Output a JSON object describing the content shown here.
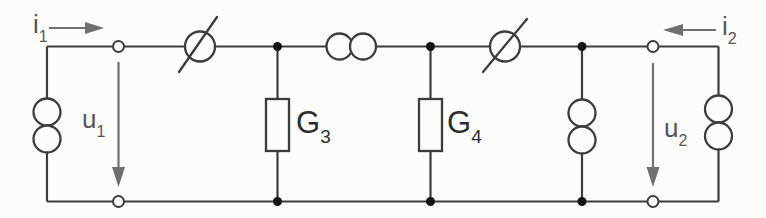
{
  "figure": {
    "kind": "two-port-circuit-schematic",
    "background_color": "#fcfcfb",
    "line_color": "#3c3c3c",
    "arrow_color": "#6f6f6f",
    "labels": {
      "i1": {
        "base": "i",
        "sub": "1"
      },
      "i2": {
        "base": "i",
        "sub": "2"
      },
      "u1": {
        "base": "u",
        "sub": "1"
      },
      "u2": {
        "base": "u",
        "sub": "2"
      },
      "g3": {
        "base": "G",
        "sub": "3"
      },
      "g4": {
        "base": "G",
        "sub": "4"
      }
    },
    "components": [
      {
        "name": "source-left",
        "symbol": "two-stacked-circles",
        "orientation": "vertical"
      },
      {
        "name": "converter-left",
        "symbol": "crossed-circle",
        "orientation": "series-top"
      },
      {
        "name": "conductance-g3",
        "symbol": "rectangle",
        "orientation": "vertical"
      },
      {
        "name": "ideal-transformer",
        "symbol": "two-overlapping-circles",
        "orientation": "horizontal"
      },
      {
        "name": "conductance-g4",
        "symbol": "rectangle",
        "orientation": "vertical"
      },
      {
        "name": "converter-right",
        "symbol": "crossed-circle",
        "orientation": "series-top"
      },
      {
        "name": "source-inner-right",
        "symbol": "two-stacked-circles",
        "orientation": "vertical"
      },
      {
        "name": "source-right",
        "symbol": "two-stacked-circles",
        "orientation": "vertical"
      }
    ],
    "ports": {
      "port1": {
        "current": "i1 into network (arrow right)",
        "voltage": "u1 top-to-bottom (arrow down)"
      },
      "port2": {
        "current": "i2 into network (arrow left)",
        "voltage": "u2 top-to-bottom (arrow down)"
      }
    }
  }
}
